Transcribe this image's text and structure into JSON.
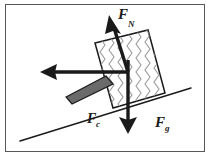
{
  "figure": {
    "background_color": "#ffffff",
    "border_color": "#58585a",
    "ink_color": "#1a1a1a",
    "block_fill": "#ffffff",
    "block_pattern_color": "#8a8a8a",
    "bar_fill": "#6a6a6a",
    "bar_stroke": "#1a1a1a"
  },
  "labels": {
    "normal_force": {
      "symbol": "F",
      "subscript": "N",
      "full": "FN"
    },
    "contact_force": {
      "symbol": "F",
      "subscript": "c",
      "full": "Fc"
    },
    "gravity_force": {
      "symbol": "F",
      "subscript": "g",
      "full": "Fg"
    }
  },
  "vectors": [
    {
      "name": "normal-force",
      "label": "FN",
      "direction": "up-left-tilted",
      "tail": [
        128,
        72
      ],
      "tip": [
        110,
        16
      ]
    },
    {
      "name": "contact-force",
      "label": "Fc",
      "direction": "left-horizontal",
      "tail": [
        128,
        72
      ],
      "tip": [
        44,
        72
      ]
    },
    {
      "name": "gravity-force",
      "label": "Fg",
      "direction": "down",
      "tail": [
        128,
        72
      ],
      "tip": [
        128,
        133
      ]
    }
  ],
  "incline": {
    "name": "inclined-surface",
    "start": [
      20,
      141
    ],
    "end": [
      191,
      88
    ]
  },
  "block": {
    "name": "textured-block",
    "corners": [
      [
        95,
        43
      ],
      [
        148,
        30
      ],
      [
        165,
        93
      ],
      [
        113,
        108
      ]
    ],
    "pattern": "vertical-wavy-lines"
  },
  "bar": {
    "name": "gray-rod",
    "corners": [
      [
        66,
        97
      ],
      [
        106,
        76
      ],
      [
        113,
        84
      ],
      [
        72,
        104
      ]
    ]
  }
}
